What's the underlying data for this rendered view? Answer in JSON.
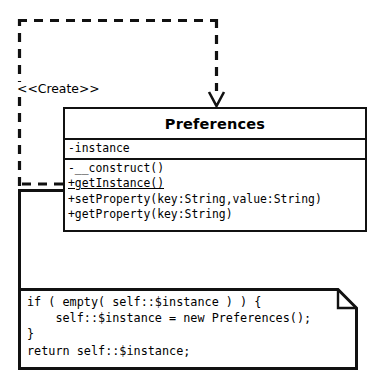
{
  "diagram": {
    "type": "uml-class-diagram",
    "title_visible": false,
    "background_color": "#ffffff",
    "stroke_color": "#111111"
  },
  "class_box": {
    "name": "Preferences",
    "attributes": [
      "-instance"
    ],
    "operations": [
      {
        "text": "-__construct()",
        "static": false
      },
      {
        "text": "+getInstance()",
        "static": true
      },
      {
        "text": "+setProperty(key:String,value:String)",
        "static": false
      },
      {
        "text": "+getProperty(key:String)",
        "static": false
      }
    ]
  },
  "dependency": {
    "stereotype_label": "<<Create>>",
    "style": "dashed",
    "arrow_head": "open-v",
    "arrow_direction": "down"
  },
  "note": {
    "lines": [
      "if ( empty( self::$instance ) ) {",
      "    self::$instance = new Preferences();",
      "}",
      "return self::$instance;"
    ],
    "text": "if ( empty( self::$instance ) ) {\n    self::$instance = new Preferences();\n}\nreturn self::$instance;",
    "corner": "folded-top-right",
    "anchor_style": "solid-line"
  }
}
